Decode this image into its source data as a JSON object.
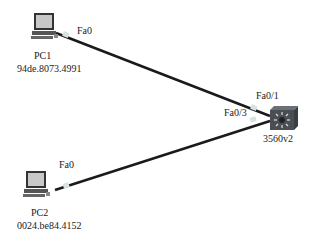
{
  "devices": [
    {
      "id": "pc1",
      "name": "PC1",
      "mac": "94de.8073.4991",
      "type": "pc",
      "port": "Fa0"
    },
    {
      "id": "pc2",
      "name": "PC2",
      "mac": "0024.be84.4152",
      "type": "pc",
      "port": "Fa0"
    },
    {
      "id": "sw",
      "name": "3560v2",
      "type": "multilayer-switch"
    }
  ],
  "links": [
    {
      "from": "PC1",
      "from_port": "Fa0",
      "to": "3560v2",
      "to_port": "Fa0/1"
    },
    {
      "from": "PC2",
      "from_port": "Fa0",
      "to": "3560v2",
      "to_port": "Fa0/3"
    }
  ],
  "colors": {
    "link": "#1a1a1a",
    "connector": "#d8e4e0",
    "switch": "#4a4f55",
    "pc_screen": "#c8c8c8"
  }
}
